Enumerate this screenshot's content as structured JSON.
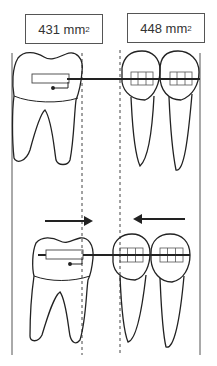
{
  "labels": {
    "left_area": {
      "value": "431 mm",
      "superscript": "2"
    },
    "right_area": {
      "value": "448 mm",
      "superscript": "2"
    }
  },
  "diagram": {
    "panels": [
      {
        "name": "before",
        "teeth": [
          "molar-with-tube",
          "premolar-with-bracket",
          "premolar-with-bracket"
        ]
      },
      {
        "name": "after",
        "teeth": [
          "molar-with-tube",
          "premolar-with-bracket",
          "premolar-with-bracket"
        ]
      }
    ],
    "arrows": [
      {
        "direction": "right",
        "meaning": "molar moves mesially"
      },
      {
        "direction": "left",
        "meaning": "premolars move distally"
      }
    ],
    "colors": {
      "line": "#222222",
      "dashed": "#444444",
      "box_border": "#555555",
      "text": "#333333"
    }
  }
}
